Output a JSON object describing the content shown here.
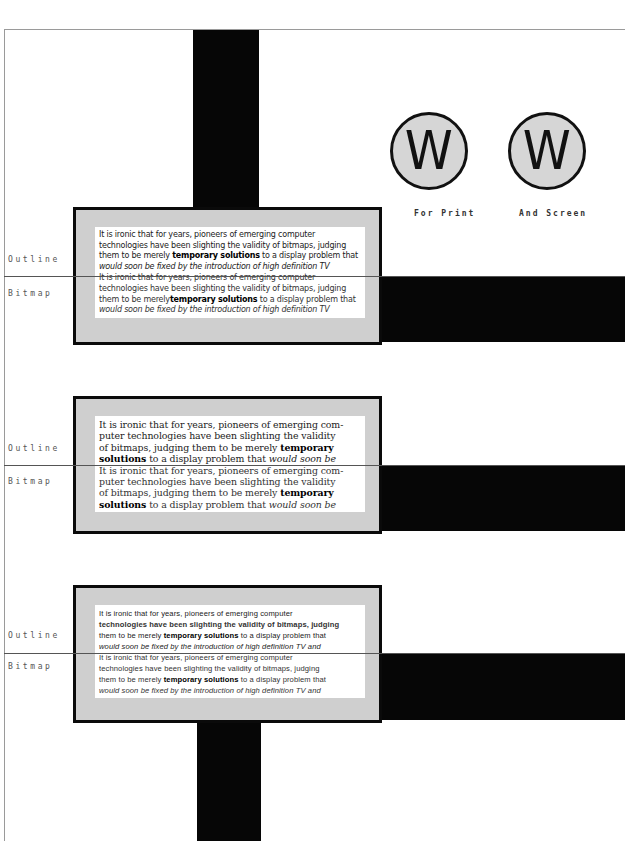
{
  "logos": {
    "print": {
      "glyph": "W",
      "caption": "For Print"
    },
    "screen": {
      "glyph": "W",
      "caption": "And Screen"
    }
  },
  "labels": {
    "outline": "Outline",
    "bitmap": "Bitmap"
  },
  "colors": {
    "bar": "#060606",
    "panel_fill": "#cfcfcf",
    "panel_border": "#0a0a0a",
    "circle_fill": "#d6d6d6"
  },
  "samples": [
    {
      "style": "sans",
      "outline": {
        "lines": [
          "It is ironic that for years, pioneers of emerging computer",
          "technologies have been slighting the validity of bitmaps, judging"
        ],
        "line3_pre": "them to be merely ",
        "line3_bold": "temporary solutions",
        "line3_post": " to a display problem that",
        "line4": "would soon be fixed by the introduction of high definition TV"
      },
      "bitmap": {
        "lines": [
          "It is ironic that for years, pioneers of emerging computer",
          "technologies have been slighting the validity of bitmaps, judging"
        ],
        "line3_pre": "them to be merely",
        "line3_bold": "temporary solutions",
        "line3_post": " to a display problem that",
        "line4": "would soon be fixed by the introduction of high definition TV"
      }
    },
    {
      "style": "serif",
      "outline": {
        "lines": [
          "It is ironic that for years, pioneers of emerging com-",
          "puter technologies have been slighting the validity"
        ],
        "line3_pre": "of bitmaps, judging them to be merely ",
        "line3_bold": "temporary",
        "line4_bold": "solutions",
        "line4_post": " to a display problem that ",
        "line4_italic": "would soon be"
      },
      "bitmap": {
        "lines": [
          "It is ironic that for years, pioneers of emerging com-",
          "puter technologies have been slighting the validity"
        ],
        "line3_pre": "of bitmaps, judging them to be merely ",
        "line3_bold": "temporary",
        "line4_bold": "solutions",
        "line4_post": " to a display problem that ",
        "line4_italic": "would soon be"
      }
    },
    {
      "style": "small-sans",
      "outline": {
        "lines": [
          "It is ironic that for years, pioneers of emerging computer",
          "technologies have been slighting the validity of bitmaps, judging"
        ],
        "line3_pre": "them to be merely ",
        "line3_bold": "temporary solutions",
        "line3_post": " to a display problem that",
        "line4": "would soon be fixed by the introduction of high definition TV and"
      },
      "bitmap": {
        "lines": [
          "It is ironic that for years, pioneers of emerging computer",
          "technologies have been slighting the validity of bitmaps, judging"
        ],
        "line3_pre": "them to be merely ",
        "line3_bold": "temporary solutions",
        "line3_post": " to a display problem that",
        "line4": "would soon be fixed by the introduction of high definition TV and"
      }
    }
  ]
}
